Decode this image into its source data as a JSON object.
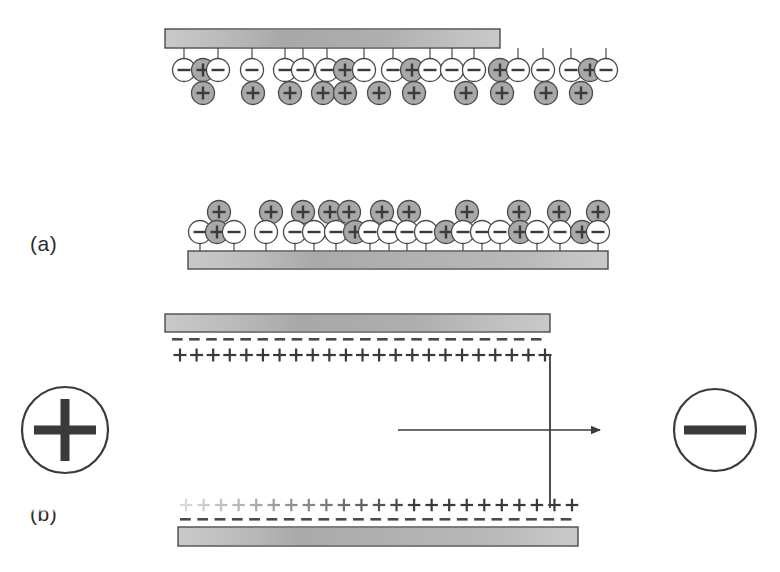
{
  "figure": {
    "background_color": "#ffffff",
    "plate_fill": "#c9c9c9",
    "plate_stroke": "#4a4a4a",
    "ion_fill_positive": "#a8a8a8",
    "ion_fill_negative": "#ffffff",
    "ion_stroke": "#4a4a4a",
    "line_color": "#3a3a3a",
    "panels": [
      {
        "id": "panel-a",
        "label": "(a)",
        "label_x": 30,
        "label_y": 232,
        "description": "Two plates with randomly mixed positive and negative ions; no applied field."
      },
      {
        "id": "panel-b",
        "label": "(b)",
        "label_x": 30,
        "label_y": 502,
        "description": "Field applied: negative charge layers at plates, positive ions ordered in rows, current path shown."
      }
    ],
    "terminals": [
      {
        "name": "positive-terminal",
        "symbol": "+",
        "cx": 65,
        "cy": 430,
        "r": 43
      },
      {
        "name": "negative-terminal",
        "symbol": "−",
        "cx": 715,
        "cy": 430,
        "r": 41
      }
    ],
    "plates": [
      {
        "name": "plate-top-a",
        "x": 165,
        "y": 29,
        "w": 335,
        "h": 19
      },
      {
        "name": "plate-bottom-a",
        "x": 188,
        "y": 251,
        "w": 420,
        "h": 18
      },
      {
        "name": "plate-top-b",
        "x": 165,
        "y": 314,
        "w": 385,
        "h": 18
      },
      {
        "name": "plate-bottom-b",
        "x": 178,
        "y": 527,
        "w": 400,
        "h": 19
      }
    ],
    "panel_a_top": {
      "stem_length": 12,
      "attached_row": [
        {
          "x": 184,
          "sign": "-"
        },
        {
          "x": 203,
          "sign": "+"
        },
        {
          "x": 218,
          "sign": "-"
        },
        {
          "x": 252,
          "sign": "-"
        },
        {
          "x": 285,
          "sign": "-"
        },
        {
          "x": 303,
          "sign": "-"
        },
        {
          "x": 327,
          "sign": "-"
        },
        {
          "x": 345,
          "sign": "+"
        },
        {
          "x": 364,
          "sign": "-"
        },
        {
          "x": 393,
          "sign": "-"
        },
        {
          "x": 412,
          "sign": "+"
        },
        {
          "x": 430,
          "sign": "-"
        },
        {
          "x": 452,
          "sign": "-"
        },
        {
          "x": 474,
          "sign": "-"
        },
        {
          "x": 500,
          "sign": "+"
        },
        {
          "x": 518,
          "sign": "-"
        },
        {
          "x": 543,
          "sign": "-"
        },
        {
          "x": 571,
          "sign": "-"
        },
        {
          "x": 590,
          "sign": "+"
        },
        {
          "x": 606,
          "sign": "-"
        }
      ],
      "free_row": [
        {
          "x": 203,
          "sign": "+"
        },
        {
          "x": 253,
          "sign": "+"
        },
        {
          "x": 290,
          "sign": "+"
        },
        {
          "x": 323,
          "sign": "+"
        },
        {
          "x": 345,
          "sign": "+"
        },
        {
          "x": 379,
          "sign": "+"
        },
        {
          "x": 414,
          "sign": "+"
        },
        {
          "x": 466,
          "sign": "+"
        },
        {
          "x": 502,
          "sign": "+"
        },
        {
          "x": 546,
          "sign": "+"
        },
        {
          "x": 581,
          "sign": "+"
        }
      ]
    },
    "panel_a_bottom": {
      "stem_length": 12,
      "attached_row": [
        {
          "x": 200,
          "sign": "-"
        },
        {
          "x": 217,
          "sign": "+"
        },
        {
          "x": 234,
          "sign": "-"
        },
        {
          "x": 266,
          "sign": "-"
        },
        {
          "x": 295,
          "sign": "-"
        },
        {
          "x": 314,
          "sign": "-"
        },
        {
          "x": 336,
          "sign": "-"
        },
        {
          "x": 355,
          "sign": "+"
        },
        {
          "x": 370,
          "sign": "-"
        },
        {
          "x": 389,
          "sign": "-"
        },
        {
          "x": 407,
          "sign": "-"
        },
        {
          "x": 426,
          "sign": "-"
        },
        {
          "x": 446,
          "sign": "+"
        },
        {
          "x": 463,
          "sign": "-"
        },
        {
          "x": 482,
          "sign": "-"
        },
        {
          "x": 500,
          "sign": "-"
        },
        {
          "x": 520,
          "sign": "+"
        },
        {
          "x": 537,
          "sign": "-"
        },
        {
          "x": 560,
          "sign": "-"
        },
        {
          "x": 582,
          "sign": "+"
        },
        {
          "x": 598,
          "sign": "-"
        }
      ],
      "free_row": [
        {
          "x": 219,
          "sign": "+"
        },
        {
          "x": 271,
          "sign": "+"
        },
        {
          "x": 303,
          "sign": "+"
        },
        {
          "x": 330,
          "sign": "+"
        },
        {
          "x": 349,
          "sign": "+"
        },
        {
          "x": 382,
          "sign": "+"
        },
        {
          "x": 409,
          "sign": "+"
        },
        {
          "x": 467,
          "sign": "+"
        },
        {
          "x": 519,
          "sign": "+"
        },
        {
          "x": 559,
          "sign": "+"
        },
        {
          "x": 598,
          "sign": "+"
        }
      ]
    },
    "panel_b_top": {
      "dash_line_y": 338,
      "dash_x_start": 172,
      "dash_x_end": 548,
      "plus_row_y": 355,
      "plus_x_start": 180,
      "plus_x_end": 545,
      "plus_count": 23
    },
    "panel_b_bottom": {
      "plus_row_y": 505,
      "dash_line_y": 518,
      "plus_x_start": 186,
      "plus_x_end": 572,
      "plus_count": 23,
      "faded_left_count": 11
    },
    "circuit": {
      "vertical_x": 550,
      "vertical_y_top": 356,
      "vertical_y_bottom": 508,
      "arrow_y": 430,
      "arrow_x_start": 398,
      "arrow_x_end": 605
    }
  }
}
